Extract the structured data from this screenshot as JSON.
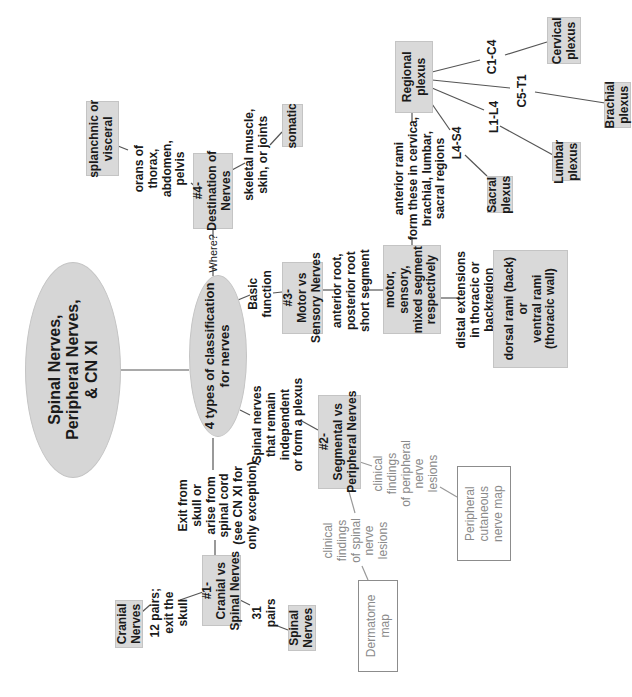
{
  "diagram": {
    "orientation": "rotated -90 degrees (text reads bottom-to-top)",
    "root": {
      "label": "Spinal Nerves,\nPeripheral Nerves,\n& CN XI"
    },
    "hub": {
      "label": "4 types of classification\nfor nerves"
    },
    "branches": {
      "b1": {
        "edge_label": "Exit from\nskull or\narise from\nspinal cord\n(see CN XI for\nonly exception)",
        "node": "#1-\nCranial vs\nSpinal Nerves",
        "children": [
          {
            "edge_label": "12 pairs;\nexit the\nskull",
            "node": "Cranial\nNerves"
          },
          {
            "edge_label": "31\npairs",
            "node": "Spinal\nNerves"
          }
        ]
      },
      "b2": {
        "edge_label": "Spinal nerves\nthat remain\nindependent\nor form a plexus",
        "node": "#2-\nSegmental vs\nPeripheral Nerves",
        "children": [
          {
            "edge_label": "clinical\nfindings\nof spinal\nnerve\nlesions",
            "node": "Dermatome\nmap"
          },
          {
            "edge_label": "clinical\nfindings\nof peripheral\nnerve\nlesions",
            "node": "Peripheral\ncutaneous\nnerve map"
          }
        ]
      },
      "b3": {
        "edge_label": "Basic\nfunction",
        "node": "#3-\nMotor vs\nSensory Nerves",
        "child": {
          "edge_label": "anterior root,\nposterior root\nshort segment",
          "node": "motor,\nsensory,\nmixed segment\nrespectively",
          "children": [
            {
              "edge_label": "anterior rami\nform these in cervica,\nbrachial, lumbar,\nsacral regions",
              "node": "Regional\nplexus",
              "children": [
                {
                  "edge_label": "C1-C4",
                  "node": "Cervical\nplexus"
                },
                {
                  "edge_label": "C5-T1",
                  "node": "Brachial\nplexus"
                },
                {
                  "edge_label": "L1-L4",
                  "node": "Lumbar\nplexus"
                },
                {
                  "edge_label": "L4-S4",
                  "node": "Sacral\nplexus"
                }
              ]
            },
            {
              "edge_label": "distal extensions\nin thoracic or\nbackregion",
              "node": "dorsal rami (back)\nor\nventral rami\n(thoracic wall)"
            }
          ]
        }
      },
      "b4": {
        "edge_label": "Where?",
        "node": "#4-\nDestination of\nNerves",
        "children": [
          {
            "edge_label": "orans of\nthorax,\nabdomen,\npelvis",
            "node": "splanchnic or\nvisceral"
          },
          {
            "edge_label": "skeletal muscle,\nskin, or joints",
            "node": "somatic"
          }
        ]
      }
    },
    "colors": {
      "box_fill": "#d9d9d9",
      "ellipse_fill": "#d6d6d6",
      "line": "#555555",
      "grey_text": "#8a8a8a",
      "outline_box": "#8c8c8c"
    }
  }
}
